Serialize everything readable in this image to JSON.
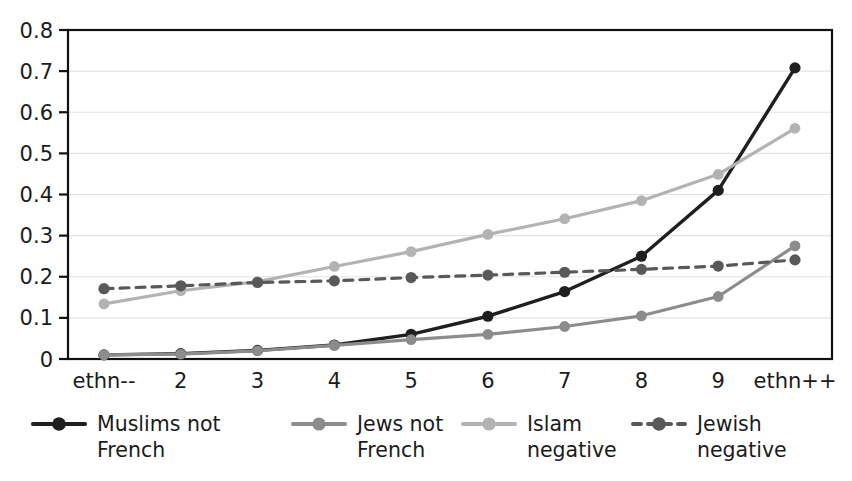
{
  "chart_data": {
    "type": "line",
    "title": "",
    "subtitle": "",
    "xlabel": "",
    "ylabel": "",
    "grid": true,
    "legend_position": "bottom",
    "xlim": [
      1,
      10
    ],
    "ylim": [
      0,
      0.8
    ],
    "x": [
      1,
      2,
      3,
      4,
      5,
      6,
      7,
      8,
      9,
      10
    ],
    "categories": [
      "ethn--",
      "2",
      "3",
      "4",
      "5",
      "6",
      "7",
      "8",
      "9",
      "ethn++"
    ],
    "xtick_labels": [
      "ethn--",
      "2",
      "3",
      "4",
      "5",
      "6",
      "7",
      "8",
      "9",
      "ethn++"
    ],
    "ytick_labels": [
      "0",
      "0.1",
      "0.2",
      "0.3",
      "0.4",
      "0.5",
      "0.6",
      "0.7",
      "0.8"
    ],
    "ytick_values": [
      0,
      0.1,
      0.2,
      0.3,
      0.4,
      0.5,
      0.6,
      0.7,
      0.8
    ],
    "series": [
      {
        "name": "Muslims not French",
        "label_line1": "Muslims not",
        "label_line2": "French",
        "color": "#1f1f1f",
        "dash": "none",
        "stroke_width": 3.4,
        "marker": "circle",
        "marker_size": 5.6,
        "values": [
          0.01,
          0.013,
          0.021,
          0.034,
          0.06,
          0.104,
          0.164,
          0.25,
          0.41,
          0.708
        ]
      },
      {
        "name": "Jews not French",
        "label_line1": "Jews not",
        "label_line2": "French",
        "color": "#8c8c8c",
        "dash": "none",
        "stroke_width": 3.2,
        "marker": "circle",
        "marker_size": 5.4,
        "values": [
          0.01,
          0.012,
          0.02,
          0.033,
          0.047,
          0.06,
          0.079,
          0.105,
          0.152,
          0.275
        ]
      },
      {
        "name": "Islam negative",
        "label_line1": "Islam",
        "label_line2": "negative",
        "color": "#b3b3b3",
        "dash": "none",
        "stroke_width": 3.2,
        "marker": "circle",
        "marker_size": 5.4,
        "values": [
          0.134,
          0.166,
          0.188,
          0.225,
          0.261,
          0.303,
          0.341,
          0.385,
          0.449,
          0.561
        ]
      },
      {
        "name": "Jewish negative",
        "label_line1": "Jewish",
        "label_line2": "negative",
        "color": "#595959",
        "dash": "9,7",
        "stroke_width": 3.2,
        "marker": "circle",
        "marker_size": 5.6,
        "values": [
          0.171,
          0.178,
          0.186,
          0.19,
          0.198,
          0.204,
          0.211,
          0.218,
          0.226,
          0.241
        ]
      }
    ]
  },
  "legend": {
    "entries": [
      {
        "label_line1": "Muslims not",
        "label_line2": "French"
      },
      {
        "label_line1": "Jews not",
        "label_line2": "French"
      },
      {
        "label_line1": "Islam",
        "label_line2": "negative"
      },
      {
        "label_line1": "Jewish",
        "label_line2": "negative"
      }
    ]
  },
  "colors": {
    "background": "#ffffff",
    "axis": "#111111",
    "grid": "#e3e3e3",
    "text": "#1b1b1b"
  }
}
